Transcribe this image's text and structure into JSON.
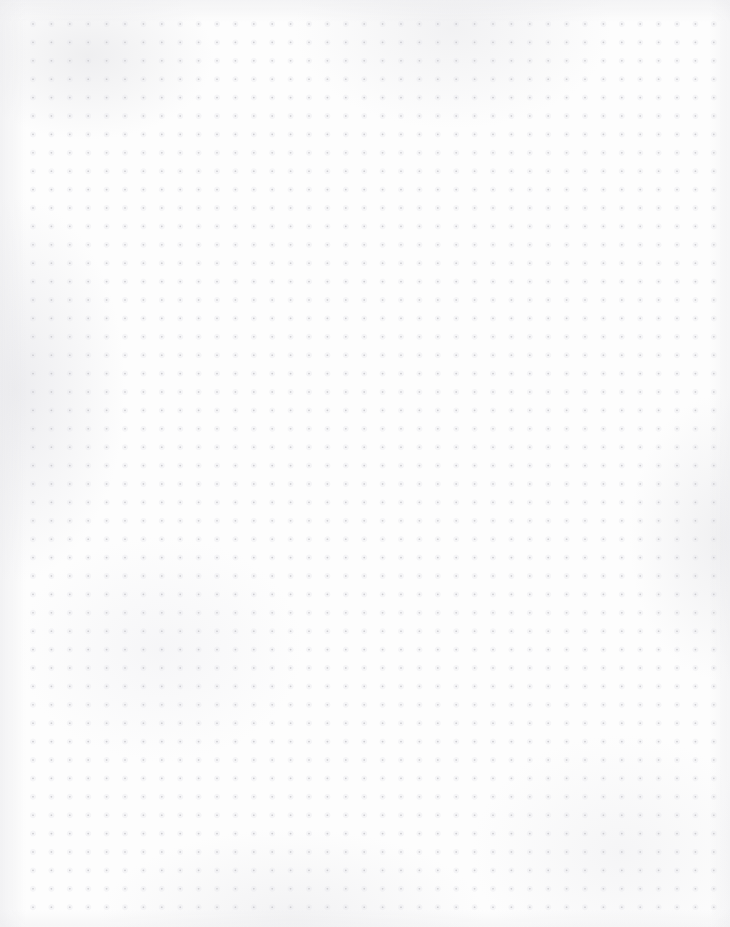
{
  "page": {
    "kind": "dot-grid-paper",
    "width": 730,
    "height": 927,
    "background_color": "#fdfdfd",
    "content_text": "",
    "has_visible_text": false
  },
  "grid": {
    "dot_color": "#c9c9cd",
    "halo_color": "#e6e6ea",
    "dot_radius": 0.85,
    "spacing_x": 18.4,
    "spacing_y": 18.4,
    "origin_x": 33,
    "origin_y": 24,
    "columns": 38,
    "rows": 49
  },
  "texture": {
    "vignette_color": "#e9e9ec",
    "mottle_color": "#eeeef0"
  }
}
